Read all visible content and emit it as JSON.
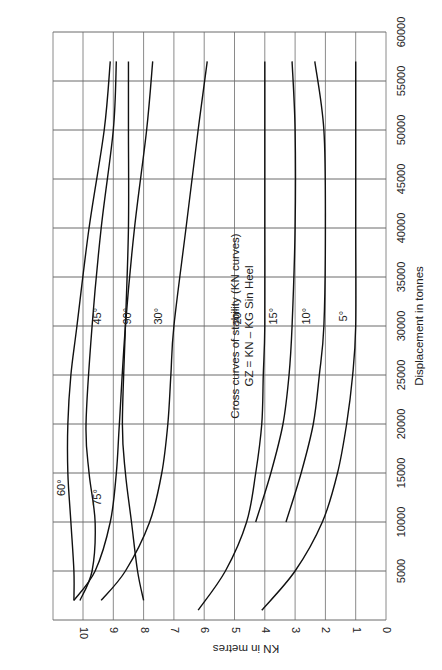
{
  "chart_data": {
    "type": "line",
    "title": "Cross curves of stability (KN curves)",
    "subtitle": "GZ = KN – KG  Sin Heel",
    "xlabel": "Displacement in tonnes",
    "ylabel": "KN in metres",
    "xlim": [
      0,
      60000
    ],
    "ylim": [
      0,
      11
    ],
    "xticks": [
      "5000",
      "10000",
      "15000",
      "20000",
      "25000",
      "30000",
      "35000",
      "40000",
      "45000",
      "50000",
      "55000",
      "60000"
    ],
    "yticks": [
      "0",
      "1",
      "2",
      "3",
      "4",
      "5",
      "6",
      "7",
      "8",
      "9",
      "10"
    ],
    "grid": true,
    "orientation": "rotated 90 degrees clockwise (displacement axis vertical, KN axis horizontal)",
    "series": [
      {
        "name": "5°",
        "points": [
          [
            1000,
            4.1
          ],
          [
            5000,
            3.0
          ],
          [
            10000,
            2.1
          ],
          [
            15000,
            1.6
          ],
          [
            20000,
            1.3
          ],
          [
            25000,
            1.1
          ],
          [
            30000,
            1.0
          ],
          [
            40000,
            1.0
          ],
          [
            50000,
            1.0
          ],
          [
            57000,
            1.0
          ]
        ],
        "label_at": [
          31000,
          1.3
        ]
      },
      {
        "name": "10°",
        "points": [
          [
            10000,
            3.3
          ],
          [
            15000,
            2.8
          ],
          [
            20000,
            2.4
          ],
          [
            25000,
            2.2
          ],
          [
            30000,
            2.05
          ],
          [
            40000,
            2.0
          ],
          [
            50000,
            2.05
          ],
          [
            57000,
            2.35
          ]
        ],
        "label_at": [
          31000,
          2.5
        ]
      },
      {
        "name": "15°",
        "points": [
          [
            10000,
            4.3
          ],
          [
            15000,
            3.8
          ],
          [
            20000,
            3.4
          ],
          [
            25000,
            3.2
          ],
          [
            30000,
            3.1
          ],
          [
            40000,
            3.0
          ],
          [
            50000,
            3.0
          ],
          [
            57000,
            3.1
          ]
        ],
        "label_at": [
          31000,
          3.6
        ]
      },
      {
        "name": "20°",
        "points": [
          [
            1000,
            6.2
          ],
          [
            5000,
            5.3
          ],
          [
            10000,
            4.6
          ],
          [
            15000,
            4.3
          ],
          [
            20000,
            4.1
          ],
          [
            25000,
            4.05
          ],
          [
            30000,
            4.0
          ],
          [
            40000,
            4.0
          ],
          [
            50000,
            4.0
          ],
          [
            57000,
            4.0
          ]
        ],
        "label_at": [
          31000,
          4.8
        ]
      },
      {
        "name": "30°",
        "points": [
          [
            2000,
            9.4
          ],
          [
            5000,
            8.6
          ],
          [
            10000,
            7.8
          ],
          [
            15000,
            7.4
          ],
          [
            20000,
            7.2
          ],
          [
            25000,
            7.1
          ],
          [
            30000,
            7.0
          ],
          [
            40000,
            6.6
          ],
          [
            50000,
            6.2
          ],
          [
            57000,
            5.9
          ]
        ],
        "label_at": [
          31000,
          7.4
        ]
      },
      {
        "name": "45°",
        "points": [
          [
            2000,
            10.3
          ],
          [
            5000,
            9.6
          ],
          [
            10000,
            9.1
          ],
          [
            15000,
            8.9
          ],
          [
            20000,
            8.8
          ],
          [
            30000,
            8.6
          ],
          [
            40000,
            8.3
          ],
          [
            50000,
            7.9
          ],
          [
            57000,
            7.7
          ]
        ],
        "label_at": [
          31000,
          9.4
        ]
      },
      {
        "name": "60°",
        "points": [
          [
            2000,
            10.3
          ],
          [
            5000,
            10.3
          ],
          [
            10000,
            10.4
          ],
          [
            15000,
            10.5
          ],
          [
            20000,
            10.5
          ],
          [
            25000,
            10.4
          ],
          [
            30000,
            10.2
          ],
          [
            40000,
            9.8
          ],
          [
            50000,
            9.3
          ],
          [
            57000,
            9.1
          ]
        ],
        "label_at": [
          13500,
          10.6
        ]
      },
      {
        "name": "75°",
        "points": [
          [
            2000,
            10.1
          ],
          [
            5000,
            9.7
          ],
          [
            10000,
            9.6
          ],
          [
            15000,
            9.8
          ],
          [
            20000,
            9.9
          ],
          [
            30000,
            9.7
          ],
          [
            40000,
            9.4
          ],
          [
            50000,
            9.0
          ],
          [
            57000,
            8.9
          ]
        ],
        "label_at": [
          12500,
          9.4
        ]
      },
      {
        "name": "90°",
        "points": [
          [
            2000,
            8.0
          ],
          [
            5000,
            8.2
          ],
          [
            10000,
            8.4
          ],
          [
            15000,
            8.6
          ],
          [
            20000,
            8.7
          ],
          [
            30000,
            8.6
          ],
          [
            40000,
            8.5
          ],
          [
            50000,
            8.5
          ],
          [
            57000,
            8.5
          ]
        ],
        "label_at": [
          31000,
          8.4
        ]
      }
    ]
  }
}
